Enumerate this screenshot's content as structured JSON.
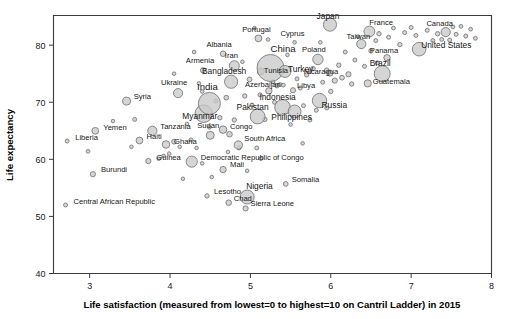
{
  "chart_data": {
    "type": "scatter",
    "title": "",
    "xlabel": "Life satisfaction (measured from lowest=0 to highest=10 on Cantril Ladder) in 2015",
    "ylabel": "Life expectancy",
    "xlim": [
      2.55,
      8.0
    ],
    "ylim": [
      40,
      85.2
    ],
    "xticks": [
      3,
      4,
      5,
      6,
      7,
      8
    ],
    "yticks": [
      40,
      50,
      60,
      70,
      80
    ],
    "grid": false,
    "legend": null,
    "note": "Bubble area encodes population; labelled points are country names.",
    "points": [
      {
        "label": "Liberia",
        "x": 2.72,
        "y": 63.2,
        "r": 2.0,
        "lx": 8,
        "ly": -1
      },
      {
        "label": "Central African Republic",
        "x": 2.7,
        "y": 52.0,
        "r": 2.0,
        "lx": 8,
        "ly": -1
      },
      {
        "label": "Burundi",
        "x": 3.04,
        "y": 57.4,
        "r": 2.6,
        "lx": 8,
        "ly": -2
      },
      {
        "label": "Yemen",
        "x": 3.07,
        "y": 65.0,
        "r": 3.4,
        "lx": 8,
        "ly": -1
      },
      {
        "label": "Syria",
        "x": 3.46,
        "y": 70.2,
        "r": 4.0,
        "lx": 7,
        "ly": -2
      },
      {
        "label": "Haiti",
        "x": 3.62,
        "y": 63.3,
        "r": 3.4,
        "lx": 7,
        "ly": -2
      },
      {
        "label": "Tanzania",
        "x": 3.78,
        "y": 65.0,
        "r": 4.6,
        "lx": 8,
        "ly": -2
      },
      {
        "label": "Guinea",
        "x": 3.73,
        "y": 59.7,
        "r": 2.6,
        "lx": 8,
        "ly": -1
      },
      {
        "label": "Ghana",
        "x": 3.95,
        "y": 62.6,
        "r": 3.8,
        "lx": 8,
        "ly": -1
      },
      {
        "label": "Ukraine",
        "x": 4.1,
        "y": 71.6,
        "r": 4.6,
        "lx": -4,
        "ly": -8
      },
      {
        "label": "Democratic Republic of Congo",
        "x": 4.27,
        "y": 59.6,
        "r": 5.6,
        "lx": 9,
        "ly": -2
      },
      {
        "label": "Lesotho",
        "x": 4.46,
        "y": 53.6,
        "r": 2.2,
        "lx": 7,
        "ly": -2
      },
      {
        "label": "Mali",
        "x": 4.66,
        "y": 58.2,
        "r": 3.2,
        "lx": 7,
        "ly": -3
      },
      {
        "label": "Sudan",
        "x": 4.5,
        "y": 64.2,
        "r": 4.0,
        "lx": -2,
        "ly": -7
      },
      {
        "label": "Myanmar",
        "x": 4.42,
        "y": 68.0,
        "r": 8.8,
        "lx": -4,
        "ly": 5
      },
      {
        "label": "India",
        "x": 4.49,
        "y": 69.8,
        "r": 11.0,
        "lx": -2,
        "ly": -13
      },
      {
        "label": "Armenia",
        "x": 4.41,
        "y": 75.6,
        "r": 2.6,
        "lx": -3,
        "ly": -7
      },
      {
        "label": "Albania",
        "x": 4.66,
        "y": 78.5,
        "r": 2.8,
        "lx": -4,
        "ly": -7
      },
      {
        "label": "Iran",
        "x": 4.8,
        "y": 76.4,
        "r": 5.0,
        "lx": -3,
        "ly": -8
      },
      {
        "label": "Bangladesh",
        "x": 4.76,
        "y": 73.6,
        "r": 6.6,
        "lx": -7,
        "ly": -8
      },
      {
        "label": "Congo",
        "x": 4.66,
        "y": 65.2,
        "r": 3.8,
        "lx": 7,
        "ly": -1
      },
      {
        "label": "Pakistan",
        "x": 5.09,
        "y": 67.5,
        "r": 7.4,
        "lx": -5,
        "ly": -7
      },
      {
        "label": "Nigeria",
        "x": 4.96,
        "y": 53.4,
        "r": 7.0,
        "lx": -1,
        "ly": -8
      },
      {
        "label": "Sierra Leone",
        "x": 4.94,
        "y": 51.4,
        "r": 2.6,
        "lx": 5,
        "ly": -2
      },
      {
        "label": "Chad",
        "x": 4.73,
        "y": 52.4,
        "r": 2.8,
        "lx": 5,
        "ly": -2
      },
      {
        "label": "South Africa",
        "x": 4.85,
        "y": 62.5,
        "r": 4.2,
        "lx": 6,
        "ly": -4
      },
      {
        "label": "Somalia",
        "x": 5.44,
        "y": 55.7,
        "r": 2.4,
        "lx": 6,
        "ly": -2
      },
      {
        "label": "Indonesia",
        "x": 5.4,
        "y": 69.1,
        "r": 7.8,
        "lx": -5,
        "ly": -7
      },
      {
        "label": "Azerbaijan",
        "x": 5.23,
        "y": 72.0,
        "r": 3.2,
        "lx": -6,
        "ly": -4
      },
      {
        "label": "Libya",
        "x": 5.53,
        "y": 72.1,
        "r": 2.6,
        "lx": 4,
        "ly": -2
      },
      {
        "label": "Tunisia",
        "x": 5.13,
        "y": 75.4,
        "r": 3.4,
        "lx": 3,
        "ly": 2
      },
      {
        "label": "China",
        "x": 5.25,
        "y": 76.0,
        "r": 13.5,
        "lx": 0,
        "ly": -16
      },
      {
        "label": "Turkey",
        "x": 5.43,
        "y": 75.4,
        "r": 6.0,
        "lx": 3,
        "ly": 1
      },
      {
        "label": "Philippines",
        "x": 5.55,
        "y": 68.4,
        "r": 6.4,
        "lx": -3,
        "ly": 9
      },
      {
        "label": "Portugal",
        "x": 5.1,
        "y": 81.2,
        "r": 3.4,
        "lx": -2,
        "ly": -6
      },
      {
        "label": "Cyprus",
        "x": 5.55,
        "y": 80.5,
        "r": 1.8,
        "lx": -2,
        "ly": -6
      },
      {
        "label": "Japan",
        "x": 5.99,
        "y": 83.6,
        "r": 6.6,
        "lx": -2,
        "ly": -6
      },
      {
        "label": "Russia",
        "x": 5.86,
        "y": 70.3,
        "r": 7.2,
        "lx": 2,
        "ly": 7
      },
      {
        "label": "Poland",
        "x": 5.84,
        "y": 77.5,
        "r": 5.2,
        "lx": -4,
        "ly": -7
      },
      {
        "label": "Nicaragua",
        "x": 5.99,
        "y": 75.1,
        "r": 3.0,
        "lx": -9,
        "ly": 1
      },
      {
        "label": "France",
        "x": 6.48,
        "y": 82.4,
        "r": 5.4,
        "lx": 0,
        "ly": -6
      },
      {
        "label": "Taiwan",
        "x": 6.38,
        "y": 80.2,
        "r": 4.6,
        "lx": -3,
        "ly": -5
      },
      {
        "label": "Brazil",
        "x": 6.64,
        "y": 75.0,
        "r": 8.0,
        "lx": -2,
        "ly": -8
      },
      {
        "label": "Panama",
        "x": 6.7,
        "y": 77.8,
        "r": 3.2,
        "lx": -3,
        "ly": -5
      },
      {
        "label": "Guatemala",
        "x": 6.46,
        "y": 73.3,
        "r": 3.6,
        "lx": 5,
        "ly": 1
      },
      {
        "label": "United States",
        "x": 7.1,
        "y": 79.3,
        "r": 6.8,
        "lx": 2,
        "ly": -1
      },
      {
        "label": "Canada",
        "x": 7.43,
        "y": 82.3,
        "r": 4.6,
        "lx": -6,
        "ly": -6
      }
    ],
    "unlabeled_points": [
      {
        "x": 2.98,
        "y": 61.4,
        "r": 1.9
      },
      {
        "x": 3.29,
        "y": 66.7,
        "r": 1.8
      },
      {
        "x": 3.52,
        "y": 62.2,
        "r": 1.8
      },
      {
        "x": 3.56,
        "y": 67.0,
        "r": 2.0
      },
      {
        "x": 3.86,
        "y": 60.1,
        "r": 1.8
      },
      {
        "x": 3.92,
        "y": 60.6,
        "r": 1.8
      },
      {
        "x": 3.99,
        "y": 61.0,
        "r": 1.8
      },
      {
        "x": 4.05,
        "y": 63.1,
        "r": 2.4
      },
      {
        "x": 4.12,
        "y": 62.2,
        "r": 1.8
      },
      {
        "x": 4.16,
        "y": 56.6,
        "r": 1.8
      },
      {
        "x": 4.21,
        "y": 66.2,
        "r": 1.8
      },
      {
        "x": 4.26,
        "y": 63.4,
        "r": 2.0
      },
      {
        "x": 4.33,
        "y": 62.0,
        "r": 1.8
      },
      {
        "x": 4.4,
        "y": 71.9,
        "r": 1.8
      },
      {
        "x": 4.36,
        "y": 73.3,
        "r": 1.8
      },
      {
        "x": 4.49,
        "y": 65.6,
        "r": 1.8
      },
      {
        "x": 4.52,
        "y": 56.9,
        "r": 1.8
      },
      {
        "x": 4.57,
        "y": 70.2,
        "r": 2.0
      },
      {
        "x": 4.62,
        "y": 67.3,
        "r": 2.2
      },
      {
        "x": 4.7,
        "y": 70.8,
        "r": 2.4
      },
      {
        "x": 4.74,
        "y": 64.4,
        "r": 2.8
      },
      {
        "x": 4.8,
        "y": 66.9,
        "r": 2.2
      },
      {
        "x": 4.86,
        "y": 62.0,
        "r": 2.0
      },
      {
        "x": 4.9,
        "y": 77.1,
        "r": 1.8
      },
      {
        "x": 4.93,
        "y": 71.1,
        "r": 2.2
      },
      {
        "x": 4.96,
        "y": 58.0,
        "r": 1.8
      },
      {
        "x": 4.99,
        "y": 74.0,
        "r": 2.4
      },
      {
        "x": 5.02,
        "y": 69.5,
        "r": 2.0
      },
      {
        "x": 5.05,
        "y": 83.0,
        "r": 1.8
      },
      {
        "x": 5.08,
        "y": 62.0,
        "r": 2.0
      },
      {
        "x": 5.12,
        "y": 71.3,
        "r": 2.0
      },
      {
        "x": 5.18,
        "y": 67.0,
        "r": 2.2
      },
      {
        "x": 5.22,
        "y": 81.0,
        "r": 1.8
      },
      {
        "x": 5.28,
        "y": 73.6,
        "r": 2.0
      },
      {
        "x": 5.33,
        "y": 72.9,
        "r": 2.2
      },
      {
        "x": 5.37,
        "y": 73.1,
        "r": 1.9
      },
      {
        "x": 5.41,
        "y": 73.0,
        "r": 1.9
      },
      {
        "x": 5.46,
        "y": 78.3,
        "r": 1.8
      },
      {
        "x": 5.5,
        "y": 66.1,
        "r": 1.8
      },
      {
        "x": 5.58,
        "y": 74.1,
        "r": 2.0
      },
      {
        "x": 5.62,
        "y": 72.5,
        "r": 2.0
      },
      {
        "x": 5.66,
        "y": 69.4,
        "r": 2.0
      },
      {
        "x": 5.7,
        "y": 74.8,
        "r": 2.2
      },
      {
        "x": 5.74,
        "y": 66.9,
        "r": 2.0
      },
      {
        "x": 5.78,
        "y": 75.9,
        "r": 2.2
      },
      {
        "x": 5.82,
        "y": 68.6,
        "r": 2.0
      },
      {
        "x": 5.87,
        "y": 80.5,
        "r": 1.8
      },
      {
        "x": 5.9,
        "y": 73.5,
        "r": 2.0
      },
      {
        "x": 5.95,
        "y": 75.6,
        "r": 2.4
      },
      {
        "x": 6.0,
        "y": 71.9,
        "r": 2.2
      },
      {
        "x": 6.05,
        "y": 73.8,
        "r": 2.6
      },
      {
        "x": 6.1,
        "y": 76.5,
        "r": 2.2
      },
      {
        "x": 6.14,
        "y": 74.3,
        "r": 2.4
      },
      {
        "x": 6.18,
        "y": 78.8,
        "r": 2.0
      },
      {
        "x": 6.22,
        "y": 74.9,
        "r": 2.6
      },
      {
        "x": 6.26,
        "y": 73.2,
        "r": 2.2
      },
      {
        "x": 6.3,
        "y": 77.4,
        "r": 2.0
      },
      {
        "x": 6.34,
        "y": 81.5,
        "r": 1.9
      },
      {
        "x": 6.42,
        "y": 76.3,
        "r": 2.0
      },
      {
        "x": 6.5,
        "y": 79.0,
        "r": 2.2
      },
      {
        "x": 6.56,
        "y": 80.8,
        "r": 2.0
      },
      {
        "x": 6.6,
        "y": 82.0,
        "r": 2.2
      },
      {
        "x": 6.72,
        "y": 81.4,
        "r": 2.0
      },
      {
        "x": 6.78,
        "y": 83.0,
        "r": 1.9
      },
      {
        "x": 6.86,
        "y": 80.1,
        "r": 2.2
      },
      {
        "x": 6.92,
        "y": 82.2,
        "r": 2.0
      },
      {
        "x": 7.0,
        "y": 83.1,
        "r": 2.0
      },
      {
        "x": 7.06,
        "y": 81.7,
        "r": 2.0
      },
      {
        "x": 7.2,
        "y": 82.6,
        "r": 2.0
      },
      {
        "x": 7.27,
        "y": 80.8,
        "r": 2.0
      },
      {
        "x": 7.33,
        "y": 82.0,
        "r": 2.2
      },
      {
        "x": 7.38,
        "y": 81.0,
        "r": 1.9
      },
      {
        "x": 7.48,
        "y": 80.9,
        "r": 2.0
      },
      {
        "x": 7.52,
        "y": 83.2,
        "r": 1.9
      },
      {
        "x": 7.56,
        "y": 81.9,
        "r": 2.0
      },
      {
        "x": 7.62,
        "y": 83.3,
        "r": 1.9
      },
      {
        "x": 7.68,
        "y": 81.6,
        "r": 2.0
      },
      {
        "x": 7.74,
        "y": 82.8,
        "r": 1.9
      },
      {
        "x": 7.8,
        "y": 81.2,
        "r": 1.9
      },
      {
        "x": 4.3,
        "y": 78.8,
        "r": 1.8
      },
      {
        "x": 4.05,
        "y": 75.0,
        "r": 1.8
      },
      {
        "x": 5.65,
        "y": 62.8,
        "r": 1.8
      },
      {
        "x": 5.13,
        "y": 60.1,
        "r": 1.8
      },
      {
        "x": 4.72,
        "y": 61.3,
        "r": 1.8
      },
      {
        "x": 4.4,
        "y": 59.3,
        "r": 1.8
      },
      {
        "x": 6.58,
        "y": 76.9,
        "r": 2.0
      },
      {
        "x": 5.95,
        "y": 69.0,
        "r": 2.0
      },
      {
        "x": 5.3,
        "y": 70.0,
        "r": 2.0
      }
    ]
  },
  "axis": {
    "x_title": "Life satisfaction (measured from lowest=0 to highest=10 on Cantril Ladder) in 2015",
    "y_title": "Life expectancy"
  }
}
